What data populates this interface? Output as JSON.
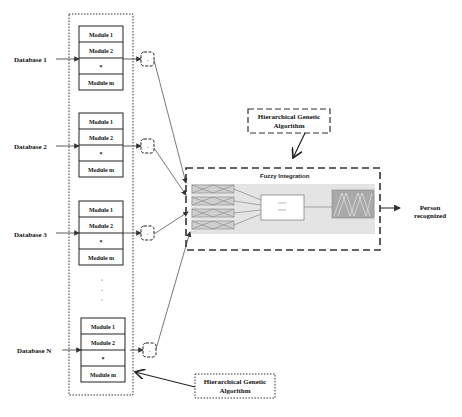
{
  "diagram": {
    "databases": [
      {
        "label": "Database 1",
        "modules": [
          "Module 1",
          "Module 2",
          "*",
          "Module m"
        ]
      },
      {
        "label": "Database 2",
        "modules": [
          "Module 1",
          "Module 2",
          "*",
          "Module m"
        ]
      },
      {
        "label": "Database 3",
        "modules": [
          "Module 1",
          "Module 2",
          "*",
          "Module m"
        ]
      },
      {
        "label": "Database N",
        "modules": [
          "Module 1",
          "Module 2",
          "*",
          "Module m"
        ]
      }
    ],
    "ellipsis": ".",
    "integrator_box_label": "-",
    "fuzzy": {
      "title": "Fuzzy Integration"
    },
    "hga_top": {
      "line1": "Hierarchical Genetic",
      "line2": "Algorithm"
    },
    "hga_bottom": {
      "line1": "Hierarchical Genetic",
      "line2": "Algorithm"
    },
    "output": {
      "line1": "Person",
      "line2": "recognized"
    }
  }
}
